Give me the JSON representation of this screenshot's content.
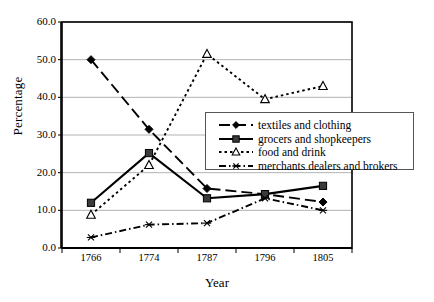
{
  "chart_data": {
    "type": "line",
    "title": "",
    "xlabel": "Year",
    "ylabel": "Percentage",
    "categories": [
      "1766",
      "1774",
      "1787",
      "1796",
      "1805"
    ],
    "ylim": [
      0,
      60
    ],
    "yticks": [
      "0.0",
      "10.0",
      "20.0",
      "30.0",
      "40.0",
      "50.0",
      "60.0"
    ],
    "ytick_values": [
      0,
      10,
      20,
      30,
      40,
      50,
      60
    ],
    "grid": "horizontal",
    "legend_position": "center-right",
    "series": [
      {
        "name": "textiles and clothing",
        "values": [
          50.0,
          31.5,
          15.8,
          14.3,
          12.2
        ],
        "marker": "diamond",
        "line": "dashed",
        "color": "#000000"
      },
      {
        "name": "grocers and shopkeepers",
        "values": [
          12.0,
          25.2,
          13.2,
          14.3,
          16.5
        ],
        "marker": "square",
        "line": "solid",
        "color": "#000000"
      },
      {
        "name": "food and drink",
        "values": [
          8.8,
          22.0,
          51.5,
          39.5,
          43.0
        ],
        "marker": "open-triangle",
        "line": "dotted",
        "color": "#000000"
      },
      {
        "name": "merchants dealers and brokers",
        "values": [
          2.8,
          6.2,
          6.6,
          13.2,
          10.0
        ],
        "marker": "star",
        "line": "dash-dot",
        "color": "#000000"
      }
    ]
  },
  "axes": {
    "ylabel": "Percentage",
    "xlabel": "Year"
  },
  "legend": {
    "items": [
      "textiles and clothing",
      "grocers and shopkeepers",
      "food and drink",
      "merchants dealers and brokers"
    ]
  },
  "colors": {
    "line": "#000000",
    "grid": "#b3b3b3",
    "frame": "#000000",
    "background": "#ffffff"
  }
}
